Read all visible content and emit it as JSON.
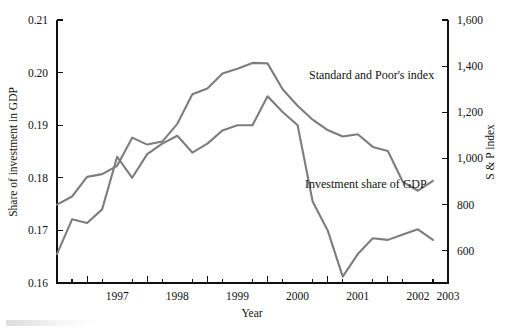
{
  "chart_data": {
    "type": "line",
    "title": "",
    "xlabel": "Year",
    "ylabel": "Share of investment in GDP",
    "y2label": "S & P index",
    "grid": false,
    "legend": "inline-annotations",
    "xlim": [
      1996.5,
      2003.0
    ],
    "ylim": [
      0.16,
      0.21
    ],
    "y2lim": [
      460,
      1600
    ],
    "x_tick_values": [
      1997,
      1998,
      1999,
      2000,
      2001,
      2002,
      2003
    ],
    "x_tick_labels": [
      "1997",
      "1998",
      "1999",
      "2000",
      "2001",
      "2002",
      "2003"
    ],
    "x_minor_ticks": [
      1996.75,
      1997.25,
      1997.75,
      1998.25,
      1998.75,
      1999.25,
      1999.75,
      2000.25,
      2000.75,
      2001.25,
      2001.75,
      2002.25,
      2002.75
    ],
    "y_tick_values": [
      0.16,
      0.17,
      0.18,
      0.19,
      0.2,
      0.21
    ],
    "y_tick_labels": [
      "0.16",
      "0.17",
      "0.18",
      "0.19",
      "0.20",
      "0.21"
    ],
    "y2_tick_values": [
      600,
      800,
      1000,
      1200,
      1400,
      1600
    ],
    "y2_tick_labels": [
      "600",
      "800",
      "1,000",
      "1,200",
      "1,400",
      "1,600"
    ],
    "x": [
      1996.5,
      1996.75,
      1997.0,
      1997.25,
      1997.5,
      1997.75,
      1998.0,
      1998.25,
      1998.5,
      1998.75,
      1999.0,
      1999.25,
      1999.5,
      1999.75,
      2000.0,
      2000.25,
      2000.5,
      2000.75,
      2001.0,
      2001.25,
      2001.5,
      2001.75,
      2002.0,
      2002.25,
      2002.5,
      2002.75
    ],
    "series": [
      {
        "name": "Standard and Poor's index",
        "axis": "right",
        "color": "#7d7d7d",
        "annotation": "Standard and Poor's index",
        "values_left_axis_equivalent": [
          0.179,
          0.1805,
          0.1843,
          0.1848,
          0.1864,
          0.1918,
          0.1904,
          0.191,
          0.1944,
          0.2,
          0.2011,
          0.204,
          0.2049,
          0.206,
          0.2059,
          0.201,
          0.1978,
          0.1952,
          0.1932,
          0.192,
          0.1924,
          0.19,
          0.1892,
          0.1833,
          0.1816,
          0.1835
        ],
        "values": [
          800,
          835,
          920,
          932,
          968,
          1090,
          1060,
          1073,
          1150,
          1278,
          1303,
          1368,
          1389,
          1414,
          1412,
          1300,
          1228,
          1168,
          1123,
          1095,
          1105,
          1050,
          1032,
          898,
          860,
          903
        ]
      },
      {
        "name": "Investment share of GDP",
        "axis": "left",
        "color": "#7d7d7d",
        "annotation": "Investment share of GDP",
        "values": [
          0.1655,
          0.1721,
          0.1714,
          0.174,
          0.184,
          0.18,
          0.1845,
          0.1865,
          0.188,
          0.1848,
          0.1865,
          0.189,
          0.19,
          0.19,
          0.1955,
          0.1925,
          0.19,
          0.1755,
          0.17,
          0.1612,
          0.1655,
          0.1685,
          0.1682,
          0.1692,
          0.1702,
          0.1682
        ]
      }
    ],
    "annotations": [
      {
        "text": "Standard and Poor's index",
        "x_px": 309,
        "y_px": 79
      },
      {
        "text": "Investment share of GDP",
        "x_px": 305,
        "y_px": 188
      }
    ]
  },
  "axes": {
    "x_title": "Year",
    "y_left_title": "Share of investment in GDP",
    "y_right_title": "S & P index"
  }
}
